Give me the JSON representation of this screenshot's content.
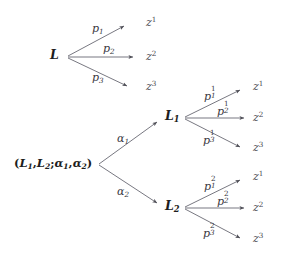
{
  "diagram": {
    "type": "probability-tree",
    "title": "",
    "background_color": "#ffffff",
    "line_color": "#5a5a62",
    "text_color": "#35353a",
    "simple_lottery": {
      "node_label": "L",
      "branches": [
        {
          "probability": "p",
          "prob_sub": "1",
          "prob_sup": "",
          "outcome": "z",
          "outcome_sup": "1"
        },
        {
          "probability": "p",
          "prob_sub": "2",
          "prob_sup": "",
          "outcome": "z",
          "outcome_sup": "2"
        },
        {
          "probability": "p",
          "prob_sub": "3",
          "prob_sup": "",
          "outcome": "z",
          "outcome_sup": "3"
        }
      ]
    },
    "compound_lottery": {
      "node_label_open": "(",
      "node_label": "L1, L2; α1, α2",
      "node_label_close": ")",
      "node_parts": {
        "L_a": "L",
        "L_a_sub": "1",
        "L_b": "L",
        "L_b_sub": "2",
        "alpha_a": "α",
        "alpha_a_sub": "1",
        "alpha_b": "α",
        "alpha_b_sub": "2",
        "sep_comma": ",",
        "sep_semicolon": ";"
      },
      "branches": [
        {
          "weight": "α",
          "weight_sub": "1",
          "sub_node": "L",
          "sub_node_sub": "1",
          "outcomes": [
            {
              "probability": "p",
              "prob_sub": "1",
              "prob_sup": "1",
              "outcome": "z",
              "outcome_sup": "1"
            },
            {
              "probability": "p",
              "prob_sub": "2",
              "prob_sup": "1",
              "outcome": "z",
              "outcome_sup": "2"
            },
            {
              "probability": "p",
              "prob_sub": "3",
              "prob_sup": "1",
              "outcome": "z",
              "outcome_sup": "3"
            }
          ]
        },
        {
          "weight": "α",
          "weight_sub": "2",
          "sub_node": "L",
          "sub_node_sub": "2",
          "outcomes": [
            {
              "probability": "p",
              "prob_sub": "1",
              "prob_sup": "2",
              "outcome": "z",
              "outcome_sup": "1"
            },
            {
              "probability": "p",
              "prob_sub": "2",
              "prob_sup": "2",
              "outcome": "z",
              "outcome_sup": "2"
            },
            {
              "probability": "p",
              "prob_sub": "3",
              "prob_sup": "2",
              "outcome": "z",
              "outcome_sup": "3"
            }
          ]
        }
      ]
    }
  }
}
